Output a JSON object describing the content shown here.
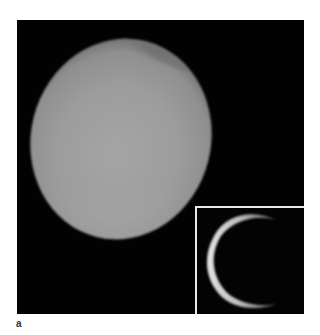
{
  "figure": {
    "panel_label": "a",
    "main_image": {
      "subject": "planetary-disk",
      "description": "Hazy grey moon/planet disk against black sky with darker polar hood at top",
      "background_color": "#020202",
      "disk_color_center": "#9a9a9a",
      "disk_color_lower": "#a8a8a8",
      "polar_hood_color": "#7c7c7c"
    },
    "inset_image": {
      "subject": "backlit-crescent-ring",
      "description": "Thin bright crescent of a backlit atmosphere ring, brightest on the left",
      "background_color": "#030303",
      "border_color": "#e8e8e8",
      "ring_color": "#d8d8d8"
    }
  }
}
